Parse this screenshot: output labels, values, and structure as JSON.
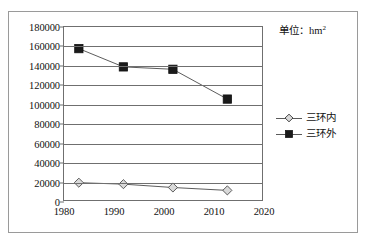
{
  "unit_note": {
    "text": "单位：hm",
    "superscript": "2"
  },
  "legend": {
    "position": "right",
    "items": [
      {
        "label": "三环内",
        "marker": "diamond-marker-icon",
        "color": "#d9d9d9"
      },
      {
        "label": "三环外",
        "marker": "square-marker-icon",
        "color": "#1a1a1a"
      }
    ]
  },
  "axes": {
    "y_ticks": [
      "180000",
      "160000",
      "140000",
      "120000",
      "100000",
      "80000",
      "60000",
      "40000",
      "20000",
      "0"
    ],
    "x_ticks": [
      "1980",
      "1990",
      "2000",
      "2010",
      "2020"
    ]
  },
  "chart_data": {
    "type": "line",
    "title": "",
    "xlabel": "",
    "ylabel": "",
    "unit": "hm²",
    "xlim": [
      1980,
      2020
    ],
    "ylim": [
      0,
      180000
    ],
    "ytick_step": 20000,
    "grid": true,
    "legend_position": "right",
    "x": [
      1983,
      1992,
      2002,
      2013
    ],
    "series": [
      {
        "name": "三环内",
        "marker": "diamond",
        "marker_fill": "#d9d9d9",
        "line_color": "#5a5a5a",
        "values": [
          18000,
          16500,
          13000,
          10000
        ]
      },
      {
        "name": "三环外",
        "marker": "square",
        "marker_fill": "#1a1a1a",
        "line_color": "#5a5a5a",
        "values": [
          157500,
          138500,
          136000,
          105000
        ]
      }
    ]
  }
}
